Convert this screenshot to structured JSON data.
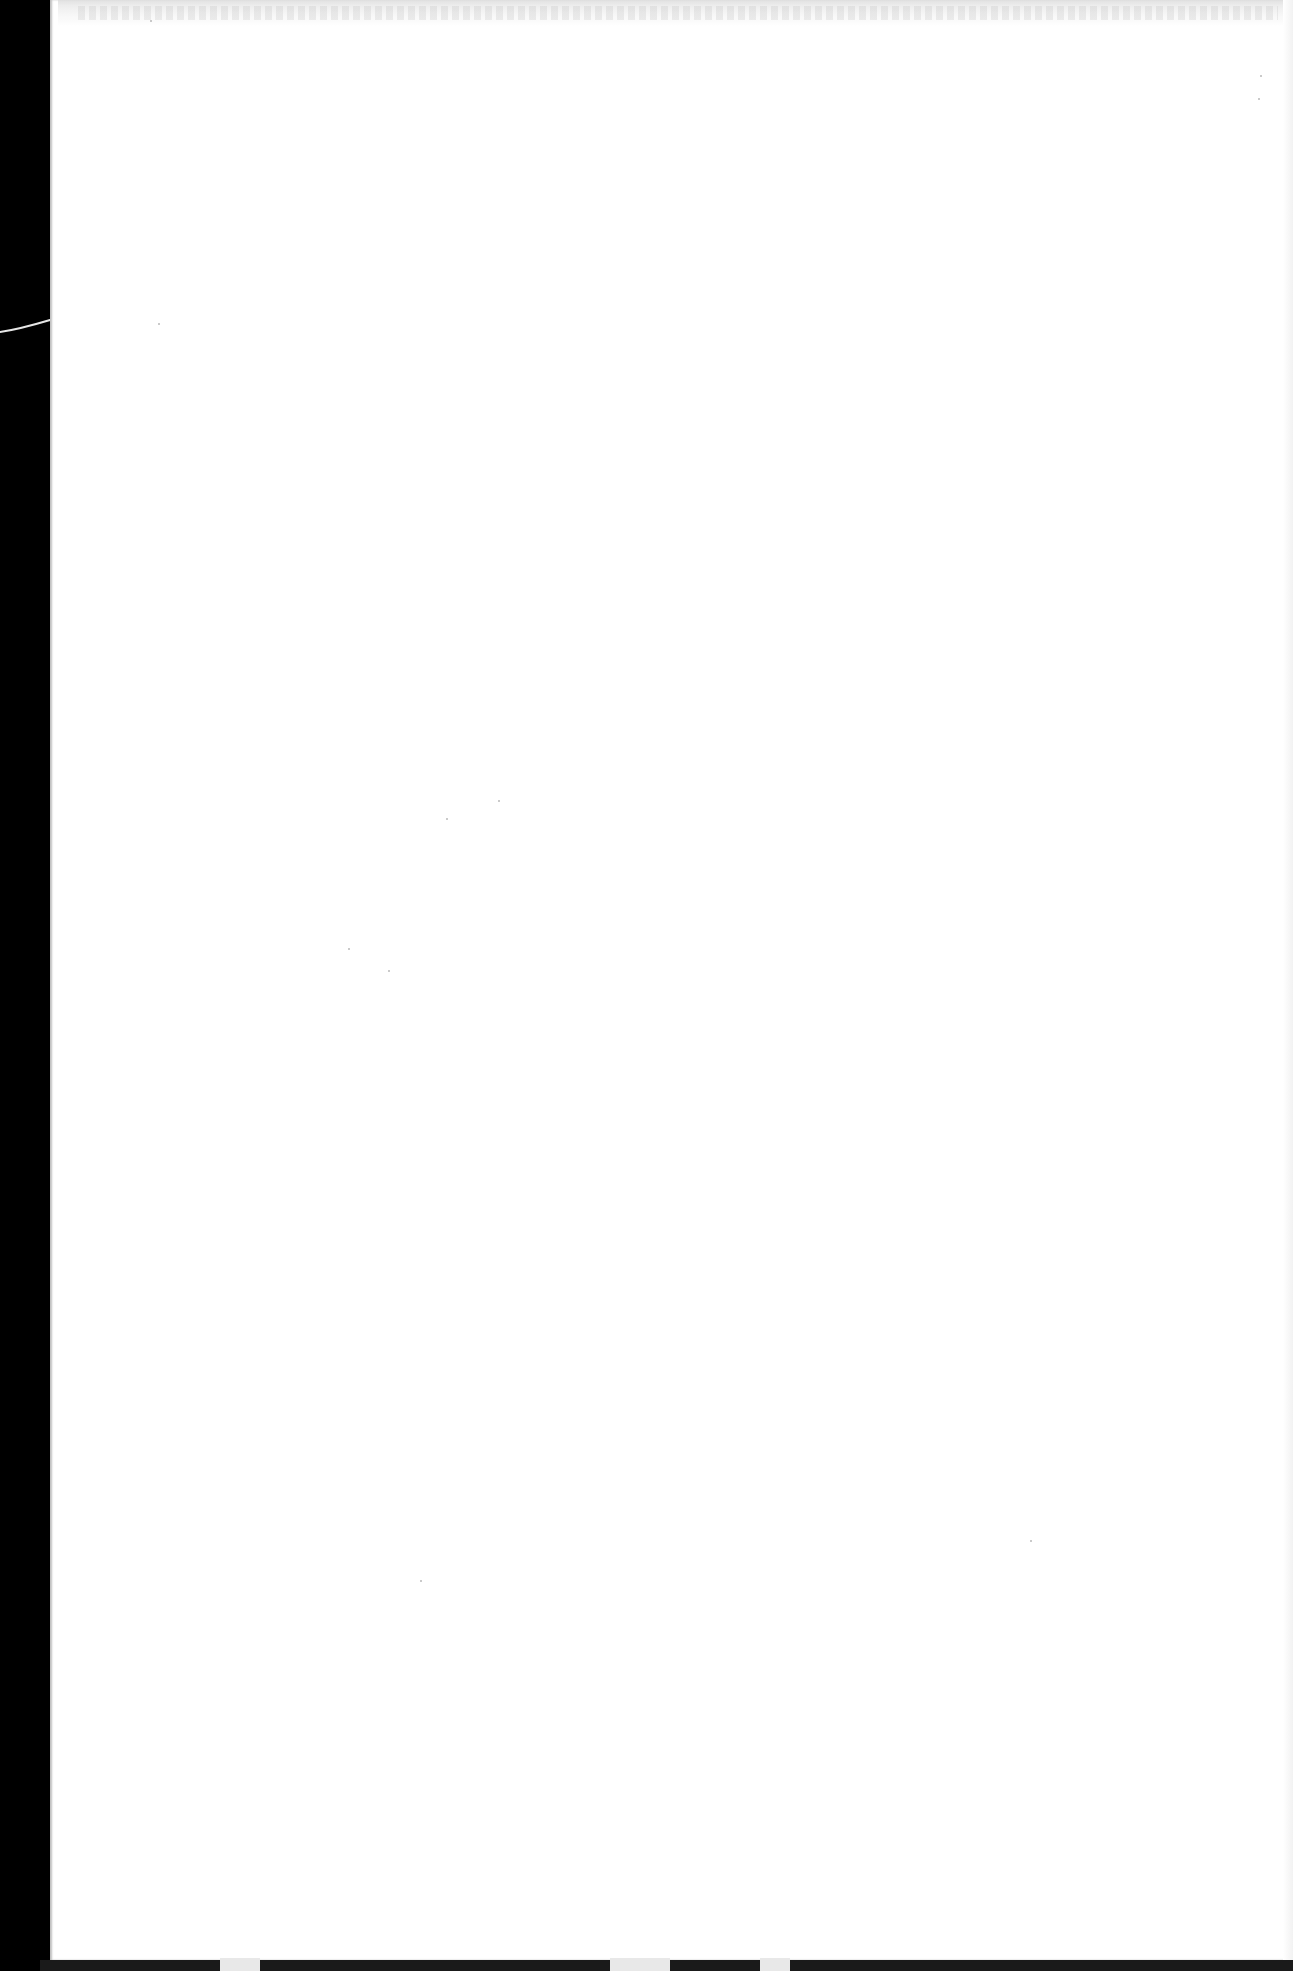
{
  "document": {
    "type": "scanned-page",
    "content": "",
    "text_legible": false,
    "page_state": "blank"
  },
  "scan": {
    "background_color": "#000000",
    "page_color": "#ffffff",
    "left_margin_px": 50,
    "artifacts": [
      "black-scanner-background-left-edge",
      "white-fiber-curve-left-margin",
      "faint-bleed-through-top-edge",
      "dark-shadow-bottom-edge",
      "dust-specks"
    ]
  }
}
